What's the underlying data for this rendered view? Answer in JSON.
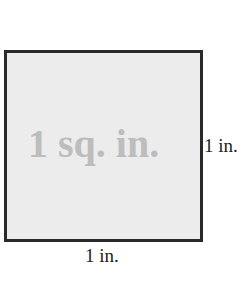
{
  "diagram": {
    "area_label": "1 sq. in.",
    "height_label": "1 in.",
    "width_label": "1 in.",
    "colors": {
      "square_fill": "#ececec",
      "border": "#2a2a2a",
      "area_text": "#bdbdbd",
      "label_text": "#222222"
    }
  }
}
